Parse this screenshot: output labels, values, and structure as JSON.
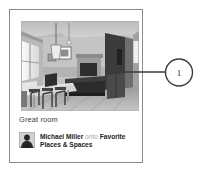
{
  "card": {
    "photo": {
      "alt_name": "interior-room-photo",
      "description": "Grayscale photo of an open-plan great room with dining table and chairs at left, tall windows, a pendant light, framed art on the wall, a dark sofa, a fireplace and a wood floor"
    },
    "caption": "Great room",
    "attribution": {
      "user": "Michael Miller",
      "connector": "onto",
      "board": "Favorite Places & Spaces",
      "avatar_name": "user-avatar"
    }
  },
  "callout": {
    "number": "1",
    "leader_from_x": 125,
    "leader_to_x": 165,
    "leader_y": 72
  },
  "colors": {
    "card_border": "#8a8a8a",
    "text": "#2f2f2f",
    "muted_text": "#a8a8a8",
    "callout_stroke": "#3a3a3a",
    "background": "#ffffff"
  }
}
